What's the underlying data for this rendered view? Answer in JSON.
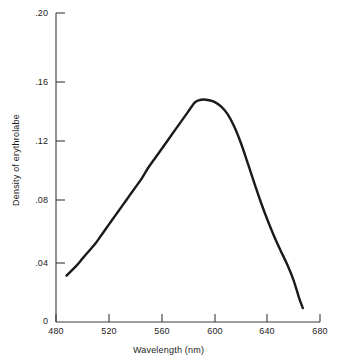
{
  "chart_data": {
    "type": "line",
    "title": "",
    "xlabel": "Wavelength (nm)",
    "ylabel": "Density of erythrolabe",
    "xlim": [
      480,
      680
    ],
    "ylim": [
      0,
      0.2
    ],
    "grid": false,
    "legend": "none",
    "xticks": [
      480,
      520,
      560,
      600,
      640,
      680
    ],
    "xtick_labels": [
      "480",
      "520",
      "560",
      "600",
      "640",
      "680"
    ],
    "yticks": [
      0,
      0.04,
      0.08,
      0.12,
      0.16,
      0.2
    ],
    "ytick_labels": [
      "0",
      ".04",
      ".08",
      ".12",
      ".16",
      ".20"
    ],
    "series": [
      {
        "name": "erythrolabe density",
        "color": "#1a1a1a",
        "line_width": 2.4,
        "x": [
          488,
          495,
          500,
          505,
          510,
          515,
          520,
          525,
          530,
          535,
          540,
          545,
          550,
          555,
          560,
          565,
          570,
          575,
          580,
          585,
          588,
          592,
          596,
          600,
          605,
          610,
          615,
          620,
          625,
          630,
          635,
          640,
          645,
          650,
          655,
          660,
          664,
          667
        ],
        "y": [
          0.03,
          0.036,
          0.041,
          0.046,
          0.051,
          0.057,
          0.063,
          0.069,
          0.075,
          0.081,
          0.087,
          0.093,
          0.1,
          0.106,
          0.112,
          0.118,
          0.124,
          0.13,
          0.136,
          0.142,
          0.1435,
          0.144,
          0.1435,
          0.1425,
          0.1395,
          0.1345,
          0.1265,
          0.116,
          0.1035,
          0.0905,
          0.078,
          0.0665,
          0.056,
          0.0465,
          0.0375,
          0.027,
          0.016,
          0.009
        ]
      }
    ]
  },
  "axes": {
    "x_axis_name": "wavelength-axis",
    "y_axis_name": "density-axis"
  }
}
